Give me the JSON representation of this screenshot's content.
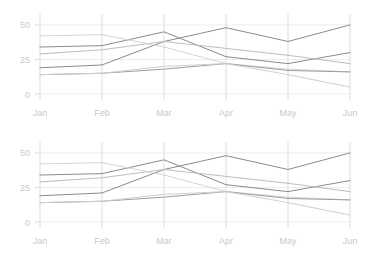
{
  "chart_data": [
    {
      "type": "line",
      "title": "",
      "subtitle": "",
      "xlabel": "",
      "ylabel": "",
      "categories": [
        "Jan",
        "Feb",
        "Mar",
        "Apr",
        "May",
        "Jun"
      ],
      "ytick_labels": [
        "0",
        "25",
        "50"
      ],
      "yticks": [
        0,
        25,
        50
      ],
      "ylim": [
        0,
        55
      ],
      "grid": true,
      "legend": "none",
      "series": [
        {
          "name": "series-1",
          "values": [
            19,
            21,
            38,
            48,
            38,
            50
          ],
          "color": "#8c8c8c"
        },
        {
          "name": "series-2",
          "values": [
            34,
            35,
            45,
            27,
            22,
            30
          ],
          "color": "#8c8c8c"
        },
        {
          "name": "series-3",
          "values": [
            29,
            32,
            38,
            33,
            28,
            22
          ],
          "color": "#bdbdbd"
        },
        {
          "name": "series-4",
          "values": [
            42,
            43,
            34,
            22,
            18,
            16
          ],
          "color": "#d4d4d4"
        },
        {
          "name": "series-5",
          "values": [
            14,
            15,
            18,
            22,
            17,
            16
          ],
          "color": "#9e9e9e"
        },
        {
          "name": "series-6",
          "values": [
            14,
            15,
            20,
            22,
            14,
            5
          ],
          "color": "#cfcfcf"
        }
      ]
    },
    {
      "type": "line",
      "title": "",
      "subtitle": "",
      "xlabel": "",
      "ylabel": "",
      "categories": [
        "Jan",
        "Feb",
        "Mar",
        "Apr",
        "May",
        "Jun"
      ],
      "ytick_labels": [
        "0",
        "25",
        "50"
      ],
      "yticks": [
        0,
        25,
        50
      ],
      "ylim": [
        0,
        55
      ],
      "grid": true,
      "legend": "none",
      "series": [
        {
          "name": "series-1",
          "values": [
            19,
            21,
            38,
            48,
            38,
            50
          ],
          "color": "#8c8c8c"
        },
        {
          "name": "series-2",
          "values": [
            34,
            35,
            45,
            27,
            22,
            30
          ],
          "color": "#8c8c8c"
        },
        {
          "name": "series-3",
          "values": [
            29,
            32,
            38,
            33,
            28,
            22
          ],
          "color": "#bdbdbd"
        },
        {
          "name": "series-4",
          "values": [
            42,
            43,
            34,
            22,
            18,
            16
          ],
          "color": "#d4d4d4"
        },
        {
          "name": "series-5",
          "values": [
            14,
            15,
            18,
            22,
            17,
            16
          ],
          "color": "#9e9e9e"
        },
        {
          "name": "series-6",
          "values": [
            14,
            15,
            20,
            22,
            14,
            5
          ],
          "color": "#cfcfcf"
        }
      ]
    }
  ],
  "style": {
    "background": "#ffffff",
    "grid_color": "#ededed",
    "vertical_grid_color": "#dcdcdc",
    "tick_label_color": "#c9c9c9"
  }
}
